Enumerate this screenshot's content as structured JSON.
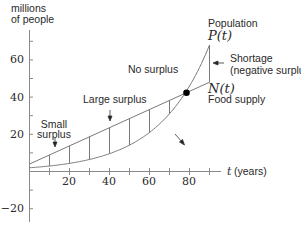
{
  "chart_data": {
    "type": "line",
    "title": "",
    "xlabel": "t (years)",
    "ylabel": "millions of people",
    "ylabel_lines": [
      "millions",
      "of people"
    ],
    "xlim": [
      0,
      92
    ],
    "ylim": [
      -25,
      75
    ],
    "x_ticks": [
      10,
      20,
      30,
      40,
      50,
      60,
      70,
      80,
      90
    ],
    "x_tick_labels": [
      {
        "value": 20,
        "label": "20"
      },
      {
        "value": 40,
        "label": "40"
      },
      {
        "value": 60,
        "label": "60"
      },
      {
        "value": 80,
        "label": "80"
      }
    ],
    "y_ticks": [
      -20,
      -10,
      10,
      20,
      30,
      40,
      50,
      60,
      70
    ],
    "y_tick_labels": [
      {
        "value": 60,
        "label": "60"
      },
      {
        "value": 40,
        "label": "40"
      },
      {
        "value": 20,
        "label": "20"
      },
      {
        "value": -20,
        "label": "−20"
      }
    ],
    "grid": false,
    "series": [
      {
        "name": "Population P(t)",
        "kind": "exponential",
        "x": [
          0,
          10,
          20,
          30,
          40,
          50,
          60,
          70,
          80,
          90
        ],
        "values": [
          2,
          3,
          4.4,
          6.5,
          9.6,
          14.2,
          21,
          31,
          46,
          68
        ]
      },
      {
        "name": "Food supply N(t)",
        "kind": "linear",
        "x": [
          0,
          10,
          20,
          30,
          40,
          50,
          60,
          70,
          80,
          90
        ],
        "values": [
          4,
          8.9,
          13.8,
          18.7,
          23.6,
          28.5,
          33.4,
          38.3,
          43.2,
          48
        ]
      }
    ],
    "hatch_lines_t": [
      10,
      20,
      30,
      40,
      50,
      60,
      70,
      90
    ],
    "intersection": {
      "t": 78.5,
      "value": 42.5
    },
    "annotations": [
      {
        "id": "population",
        "lines": [
          "Population",
          "P(t)"
        ]
      },
      {
        "id": "shortage",
        "lines": [
          "Shortage",
          "(negative surplus)"
        ]
      },
      {
        "id": "no_surplus",
        "lines": [
          "No surplus"
        ]
      },
      {
        "id": "food",
        "lines": [
          "N(t)",
          "Food supply"
        ]
      },
      {
        "id": "large_surplus",
        "lines": [
          "Large surplus"
        ]
      },
      {
        "id": "small_surplus",
        "lines": [
          "Small",
          "surplus"
        ]
      }
    ]
  },
  "labels": {
    "ylabel_1": "millions",
    "ylabel_2": "of people",
    "xlabel_t": "t",
    "xlabel_unit": "(years)",
    "population": "Population",
    "p_of_t": "P(t)",
    "shortage_1": "Shortage",
    "shortage_2": "(negative surplus)",
    "no_surplus": "No surplus",
    "n_of_t": "N(t)",
    "food_supply": "Food supply",
    "large_surplus": "Large surplus",
    "small_1": "Small",
    "small_2": "surplus",
    "y60": "60",
    "y40": "40",
    "y20": "20",
    "ym20": "−20",
    "x20": "20",
    "x40": "40",
    "x60": "60",
    "x80": "80"
  },
  "colors": {
    "axis": "#8a8a8a",
    "curve": "#7a7a7a",
    "text": "#2a2a2a",
    "dot": "#000000"
  }
}
